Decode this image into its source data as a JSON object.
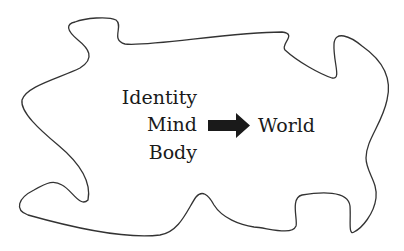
{
  "diagram": {
    "left_labels": [
      "Identity",
      "Mind",
      "Body"
    ],
    "right_label": "World",
    "arrow": {
      "icon": "right-arrow-icon",
      "color": "#1a1a1a"
    },
    "outline": {
      "shape": "irregular-blob",
      "color": "#333333"
    }
  }
}
